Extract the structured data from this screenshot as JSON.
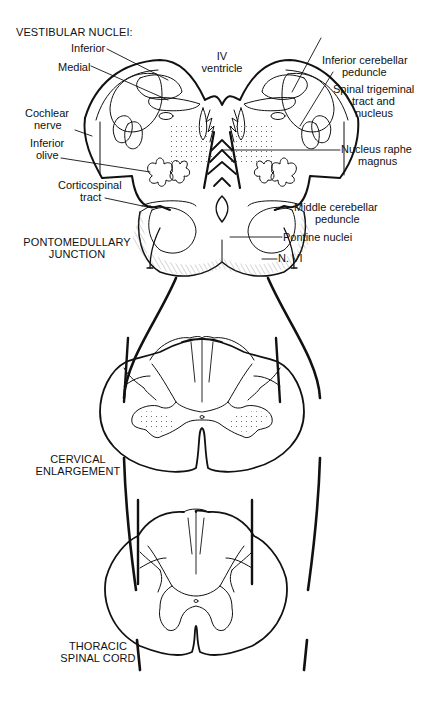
{
  "title": "VESTIBULAR NUCLEI:",
  "labels": {
    "inferior": "Inferior",
    "medial": "Medial",
    "iv_ventricle_1": "IV",
    "iv_ventricle_2": "ventricle",
    "cochlear_1": "Cochlear",
    "cochlear_2": "nerve",
    "inferior_olive_1": "Inferior",
    "inferior_olive_2": "olive",
    "corticospinal_1": "Corticospinal",
    "corticospinal_2": "tract",
    "icp_1": "Inferior cerebellar",
    "icp_2": "peduncle",
    "spinal_trig_1": "Spinal trigeminal",
    "spinal_trig_2": "tract and",
    "spinal_trig_3": "nucleus",
    "raphe_1": "Nucleus raphe",
    "raphe_2": "magnus",
    "mcp_1": "Middle cerebellar",
    "mcp_2": "peduncle",
    "pontine": "Pontine nuclei",
    "n_vi": "N. VI"
  },
  "sections": {
    "pontomedullary_1": "PONTOMEDULLARY",
    "pontomedullary_2": "JUNCTION",
    "cervical_1": "CERVICAL",
    "cervical_2": "ENLARGEMENT",
    "thoracic_1": "THORACIC",
    "thoracic_2": "SPINAL CORD"
  },
  "colors": {
    "ink": "#111111",
    "background": "#ffffff"
  }
}
